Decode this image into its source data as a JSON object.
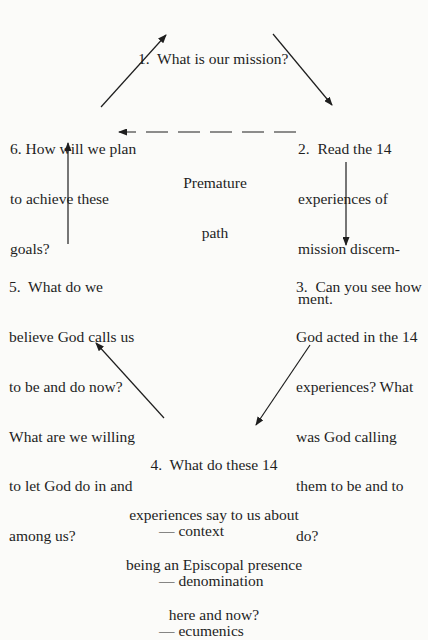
{
  "diagram": {
    "type": "cycle-flowchart",
    "nodes": [
      {
        "id": "1",
        "lines": [
          "1.  What is our mission?"
        ]
      },
      {
        "id": "2",
        "lines": [
          "2.  Read the 14",
          "experiences of",
          "mission discern-",
          "ment."
        ]
      },
      {
        "id": "3",
        "lines": [
          "3.  Can you see how",
          "God acted in the 14",
          "experiences? What",
          "was God calling",
          "them to be and to",
          "do?"
        ]
      },
      {
        "id": "4",
        "lines": [
          "4.  What do these 14",
          "experiences say to us about",
          "being an Episcopal presence",
          "here and now?"
        ],
        "sub_items": [
          "— context",
          "— denomination",
          "— ecumenics"
        ]
      },
      {
        "id": "5",
        "lines": [
          "5.  What do we",
          "believe God calls us",
          "to be and do now?",
          "What are we willing",
          "to let God do in and",
          "among us?"
        ]
      },
      {
        "id": "6",
        "lines": [
          "6. How will we plan",
          "to achieve these",
          "goals?"
        ]
      }
    ],
    "edges": [
      {
        "from": "1",
        "to": "2",
        "style": "solid"
      },
      {
        "from": "2",
        "to": "3",
        "style": "solid"
      },
      {
        "from": "3",
        "to": "4",
        "style": "solid"
      },
      {
        "from": "4",
        "to": "5",
        "style": "solid"
      },
      {
        "from": "5",
        "to": "6",
        "style": "solid"
      },
      {
        "from": "6",
        "to": "1",
        "style": "solid"
      },
      {
        "from": "2",
        "to": "6",
        "style": "dashed",
        "label_lines": [
          "Premature",
          "path"
        ]
      }
    ]
  }
}
